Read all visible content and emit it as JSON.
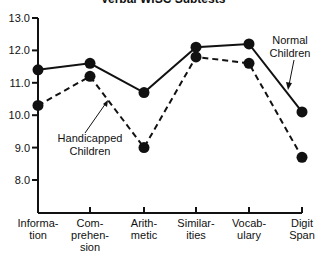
{
  "chart_data": {
    "type": "line",
    "title": "Verbal WISC Subtests",
    "xlabel": "",
    "ylabel": "",
    "ylim": [
      7.0,
      13.0
    ],
    "yticks": [
      "13.0",
      "12.0",
      "11.0",
      "10.0",
      "9.0",
      "8.0"
    ],
    "categories": [
      [
        "Informa-",
        "tion"
      ],
      [
        "Com-",
        "prehen-",
        "sion"
      ],
      [
        "Arith-",
        "metic"
      ],
      [
        "Similar-",
        "ities"
      ],
      [
        "Vocab-",
        "ulary"
      ],
      [
        "Digit",
        "Span"
      ]
    ],
    "category_names": [
      "Information",
      "Comprehension",
      "Arithmetic",
      "Similarities",
      "Vocabulary",
      "Digit Span"
    ],
    "series": [
      {
        "name": "Normal Children",
        "style": "solid",
        "values": [
          11.4,
          11.6,
          10.7,
          12.1,
          12.2,
          10.1
        ]
      },
      {
        "name": "Handicapped Children",
        "style": "dashed",
        "values": [
          10.3,
          11.2,
          9.0,
          11.8,
          11.6,
          8.7
        ]
      }
    ],
    "annotations": [
      {
        "text": [
          "Normal",
          "Children"
        ],
        "points_to": "Normal Children"
      },
      {
        "text": [
          "Handicapped",
          "Children"
        ],
        "points_to": "Handicapped Children"
      }
    ],
    "grid": false,
    "legend": "inline annotations"
  }
}
